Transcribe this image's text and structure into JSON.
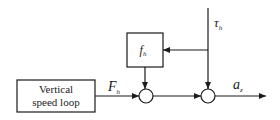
{
  "diagram": {
    "type": "block-diagram",
    "blocks": [
      {
        "id": "vertical-speed-loop",
        "label_line1": "Vertical",
        "label_line2": "speed loop"
      },
      {
        "id": "fh",
        "label": "f",
        "label_sub": "h"
      }
    ],
    "summing_junctions": [
      {
        "id": "sum1"
      },
      {
        "id": "sum2"
      }
    ],
    "signals": {
      "Fh": {
        "main": "F",
        "sub": "h"
      },
      "tau_h": {
        "main": "τ",
        "sub": "h"
      },
      "az": {
        "main": "a",
        "sub": "z"
      }
    },
    "connections": [
      {
        "from": "vertical-speed-loop",
        "to": "sum1",
        "label": "Fh"
      },
      {
        "from": "fh",
        "to": "sum1"
      },
      {
        "from": "sum1",
        "to": "sum2"
      },
      {
        "from": "tau_h-input",
        "to": "sum2",
        "label": "tau_h"
      },
      {
        "from": "tau_h-input",
        "to": "fh"
      },
      {
        "from": "sum2",
        "to": "output",
        "label": "az"
      }
    ],
    "colors": {
      "stroke": "#1a1a1a",
      "background": "#ffffff"
    }
  }
}
